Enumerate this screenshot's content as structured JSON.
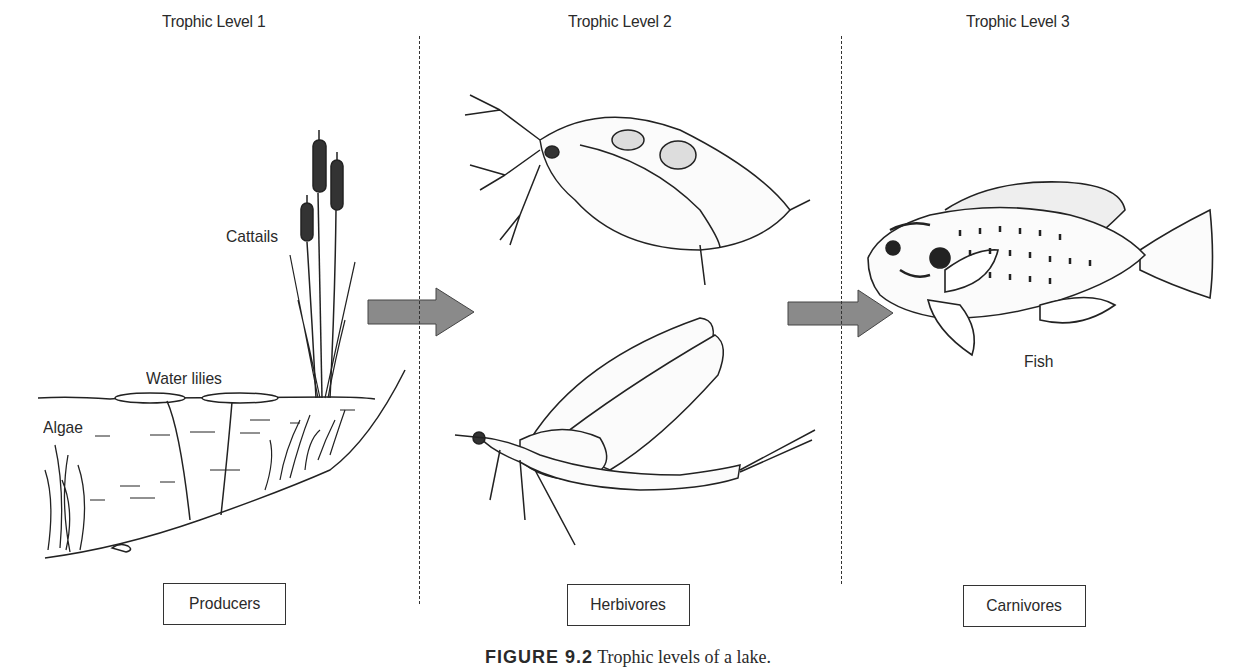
{
  "levels": [
    {
      "title": "Trophic Level 1",
      "box": "Producers"
    },
    {
      "title": "Trophic Level 2",
      "box": "Herbivores"
    },
    {
      "title": "Trophic Level 3",
      "box": "Carnivores"
    }
  ],
  "labels": {
    "cattails": "Cattails",
    "water_lilies": "Water lilies",
    "algae": "Algae",
    "fish": "Fish"
  },
  "caption": {
    "number": "FIGURE 9.2",
    "text": "Trophic levels of a lake."
  },
  "colors": {
    "arrow": "#8a8a8a",
    "ink": "#222222"
  }
}
